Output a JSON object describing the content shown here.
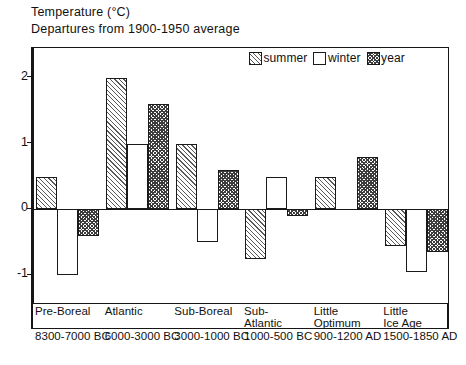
{
  "header": {
    "title_line1": "Temperature (°C)",
    "title_line2": "Departures from 1900-1950 average"
  },
  "legend": {
    "position": "top-right-inside",
    "entries": [
      {
        "label": "summer",
        "swatch": "diagonal-hatch",
        "color": "#595959"
      },
      {
        "label": "winter",
        "swatch": "white-empty",
        "color": "#ffffff"
      },
      {
        "label": "year",
        "swatch": "cross-hatch",
        "color": "#3d3d3d"
      }
    ]
  },
  "axes": {
    "y_ticks": [
      "2",
      "1",
      "0",
      "-1"
    ],
    "y_tick_values": [
      2,
      1,
      0,
      -1
    ],
    "ylim": [
      -1.45,
      2.45
    ],
    "grid": false
  },
  "categories_detail": [
    {
      "name_line1": "Pre-Boreal",
      "name_line2": "",
      "date_line1": "8300-",
      "date_line2": "7000 BC"
    },
    {
      "name_line1": "Atlantic",
      "name_line2": "",
      "date_line1": "6000-",
      "date_line2": "3000 BC"
    },
    {
      "name_line1": "Sub-Boreal",
      "name_line2": "",
      "date_line1": "3000-",
      "date_line2": "1000 BC"
    },
    {
      "name_line1": "Sub-",
      "name_line2": "Atlantic",
      "date_line1": "1000-",
      "date_line2": "500 BC"
    },
    {
      "name_line1": "Little",
      "name_line2": "Optimum",
      "date_line1": "900-",
      "date_line2": "1200 AD"
    },
    {
      "name_line1": "Little",
      "name_line2": "Ice Age",
      "date_line1": "1500-",
      "date_line2": "1850 AD"
    }
  ],
  "chart_data": {
    "type": "bar",
    "title": "Temperature (°C) Departures from 1900-1950 average",
    "xlabel": "",
    "ylabel": "Temperature (°C)",
    "ylim": [
      -1.45,
      2.45
    ],
    "yticks": [
      -1,
      0,
      1,
      2
    ],
    "grid": false,
    "legend_position": "upper right",
    "categories": [
      "Pre-Boreal",
      "Atlantic",
      "Sub-Boreal",
      "Sub-Atlantic",
      "Little Optimum",
      "Little Ice Age"
    ],
    "category_dates": [
      "8300-7000 BC",
      "6000-3000 BC",
      "3000-1000 BC",
      "1000-500 BC",
      "900-1200 AD",
      "1500-1850 AD"
    ],
    "series": [
      {
        "name": "summer",
        "values": [
          0.5,
          2.0,
          1.0,
          -0.75,
          0.5,
          -0.55
        ]
      },
      {
        "name": "winter",
        "values": [
          -1.0,
          1.0,
          -0.5,
          0.5,
          0.0,
          -0.95
        ]
      },
      {
        "name": "year",
        "values": [
          -0.4,
          1.6,
          0.6,
          -0.1,
          0.8,
          -0.65
        ]
      }
    ]
  }
}
